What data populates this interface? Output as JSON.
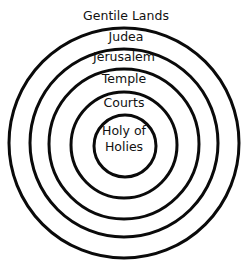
{
  "diagram": {
    "type": "concentric-circles",
    "stroke_color": "#0a0a0a",
    "background": "#ffffff",
    "labels": {
      "outer": "Gentile Lands",
      "ring1": "Judea",
      "ring2": "Jerusalem",
      "ring3": "Temple",
      "ring4": "Courts",
      "center_line1": "Holy of",
      "center_line2": "Holies"
    },
    "order_outer_to_inner": [
      "Gentile Lands",
      "Judea",
      "Jerusalem",
      "Temple",
      "Courts",
      "Holy of Holies"
    ]
  }
}
